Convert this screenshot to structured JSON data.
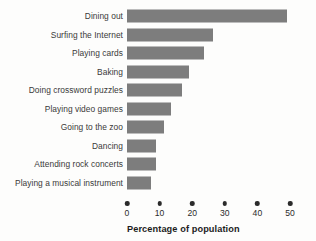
{
  "chart_data": {
    "type": "bar",
    "orientation": "horizontal",
    "title": "",
    "xlabel": "Percentage of population",
    "ylabel": "",
    "xlim": [
      0,
      50
    ],
    "xticks": [
      0,
      10,
      20,
      30,
      40,
      50
    ],
    "xtick_labels": [
      "0",
      "10",
      "20",
      "30",
      "40",
      "50"
    ],
    "grid": false,
    "legend": null,
    "bar_color": "#7d7d7d",
    "categories": [
      "Dining out",
      "Surfing the Internet",
      "Playing cards",
      "Baking",
      "Doing crossword puzzles",
      "Playing video games",
      "Going to the zoo",
      "Dancing",
      "Attending rock concerts",
      "Playing a musical instrument"
    ],
    "values": [
      49,
      26.5,
      23.5,
      19,
      17,
      13.5,
      11.5,
      9,
      9,
      7.5
    ]
  },
  "axis": {
    "title": "Percentage of population"
  },
  "cropped_header": {
    "text": ""
  }
}
